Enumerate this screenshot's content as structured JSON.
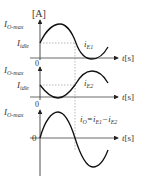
{
  "figure": {
    "unit_label": "[A]",
    "graphs": [
      {
        "id": "iE1",
        "ymax_label": "I",
        "ymax_sub": "O-max",
        "mid_label": "I",
        "mid_sub": "idle",
        "curve_label": "i",
        "curve_sub": "E1",
        "t_label": "t",
        "t_unit": "[s]"
      },
      {
        "id": "iE2",
        "zero_label": "0",
        "ymax_label": "I",
        "ymax_sub": "O-max",
        "mid_label": "I",
        "mid_sub": "idle",
        "curve_label": "i",
        "curve_sub": "E2",
        "t_label": "t",
        "t_unit": "[s]"
      },
      {
        "id": "iO",
        "zero_label_top": "0",
        "ymax_label": "I",
        "ymax_sub": "O-max",
        "zero_label": "0",
        "eq_lhs": "i",
        "eq_lhs_sub": "O",
        "eq_mid": "=i",
        "eq_mid_sub": "E1",
        "eq_minus": "−i",
        "eq_rhs_sub": "E2",
        "t_label": "t",
        "t_unit": "[s]"
      }
    ]
  }
}
